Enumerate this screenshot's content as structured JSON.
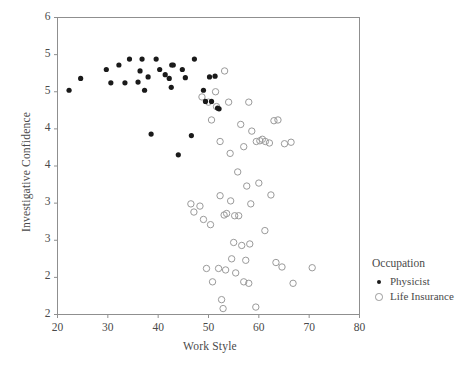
{
  "chart_data": {
    "type": "scatter",
    "title": "",
    "xlabel": "Work Style",
    "ylabel": "Investigative Confidence",
    "xlim": [
      20,
      80
    ],
    "ylim": [
      2,
      6
    ],
    "xticks": [
      20,
      30,
      40,
      50,
      60,
      70,
      80
    ],
    "xtick_labels": [
      "20",
      "30",
      "40",
      "50",
      "60",
      "70",
      "80"
    ],
    "yticks": [
      6.0,
      5.5,
      5.0,
      4.5,
      4.0,
      3.5,
      3.0,
      2.5,
      2.0
    ],
    "ytick_labels": [
      "6",
      "5",
      "5",
      "4",
      "4",
      "3",
      "3",
      "2",
      "2"
    ],
    "grid": false,
    "legend_position": "right",
    "legend_title": "Occupation",
    "series": [
      {
        "name": "Physicist",
        "marker": "filled-circle",
        "color": "#1a1a1a",
        "points": [
          [
            22.3,
            5.02
          ],
          [
            24.6,
            5.18
          ],
          [
            29.7,
            5.3
          ],
          [
            30.6,
            5.12
          ],
          [
            32.2,
            5.36
          ],
          [
            33.4,
            5.12
          ],
          [
            34.3,
            5.44
          ],
          [
            36.0,
            5.13
          ],
          [
            36.4,
            5.28
          ],
          [
            36.8,
            5.44
          ],
          [
            37.3,
            5.02
          ],
          [
            38.0,
            5.2
          ],
          [
            39.6,
            5.44
          ],
          [
            40.3,
            5.3
          ],
          [
            41.4,
            5.23
          ],
          [
            42.7,
            5.36
          ],
          [
            43.0,
            5.36
          ],
          [
            42.2,
            5.18
          ],
          [
            42.6,
            5.06
          ],
          [
            44.8,
            5.3
          ],
          [
            45.4,
            5.19
          ],
          [
            46.6,
            4.41
          ],
          [
            47.2,
            5.44
          ],
          [
            49.0,
            5.02
          ],
          [
            49.4,
            4.87
          ],
          [
            50.2,
            5.2
          ],
          [
            50.6,
            4.87
          ],
          [
            51.3,
            5.21
          ],
          [
            38.6,
            4.43
          ],
          [
            44.0,
            4.15
          ],
          [
            51.8,
            4.78
          ],
          [
            52.1,
            4.77
          ]
        ]
      },
      {
        "name": "Life Insurance",
        "marker": "open-circle",
        "color": "#9a9a9a",
        "points": [
          [
            48.7,
            4.93
          ],
          [
            50.0,
            4.86
          ],
          [
            50.6,
            4.62
          ],
          [
            51.4,
            5.0
          ],
          [
            51.6,
            4.8
          ],
          [
            52.3,
            4.33
          ],
          [
            53.2,
            5.28
          ],
          [
            54.0,
            4.86
          ],
          [
            54.3,
            4.17
          ],
          [
            55.8,
            3.92
          ],
          [
            56.4,
            4.56
          ],
          [
            57.0,
            4.26
          ],
          [
            58.0,
            4.86
          ],
          [
            58.6,
            4.47
          ],
          [
            59.5,
            4.33
          ],
          [
            60.2,
            4.34
          ],
          [
            60.7,
            4.36
          ],
          [
            61.3,
            4.33
          ],
          [
            62.1,
            4.31
          ],
          [
            63.0,
            4.61
          ],
          [
            63.8,
            4.62
          ],
          [
            65.1,
            4.3
          ],
          [
            66.4,
            4.32
          ],
          [
            46.5,
            3.49
          ],
          [
            47.1,
            3.38
          ],
          [
            48.3,
            3.46
          ],
          [
            49.0,
            3.28
          ],
          [
            50.4,
            3.21
          ],
          [
            52.3,
            3.6
          ],
          [
            53.1,
            3.34
          ],
          [
            53.6,
            3.36
          ],
          [
            54.4,
            3.53
          ],
          [
            55.2,
            3.33
          ],
          [
            56.0,
            3.33
          ],
          [
            57.6,
            3.73
          ],
          [
            58.4,
            3.49
          ],
          [
            60.0,
            3.77
          ],
          [
            61.2,
            3.13
          ],
          [
            62.4,
            3.61
          ],
          [
            55.0,
            2.97
          ],
          [
            56.6,
            2.93
          ],
          [
            57.4,
            2.73
          ],
          [
            58.2,
            2.95
          ],
          [
            49.6,
            2.62
          ],
          [
            50.8,
            2.44
          ],
          [
            52.0,
            2.62
          ],
          [
            53.4,
            2.6
          ],
          [
            54.6,
            2.75
          ],
          [
            55.4,
            2.56
          ],
          [
            57.0,
            2.44
          ],
          [
            58.0,
            2.42
          ],
          [
            63.4,
            2.7
          ],
          [
            64.6,
            2.64
          ],
          [
            66.8,
            2.42
          ],
          [
            70.6,
            2.63
          ],
          [
            52.6,
            2.2
          ],
          [
            52.9,
            2.08
          ],
          [
            59.4,
            2.1
          ]
        ]
      }
    ]
  },
  "legend": {
    "title": "Occupation",
    "entries": [
      {
        "label": "Physicist",
        "marker": "filled-circle"
      },
      {
        "label": "Life Insurance",
        "marker": "open-circle"
      }
    ]
  },
  "colors": {
    "background": "#ffffff",
    "axis": "#8f8f8f",
    "text": "#4a4a4a",
    "physicist": "#1a1a1a",
    "life_insurance": "#9a9a9a"
  }
}
